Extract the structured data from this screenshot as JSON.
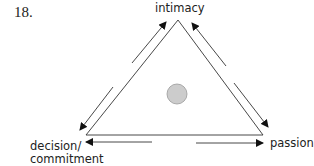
{
  "figure": {
    "number": "18."
  },
  "nodes": {
    "top": "intimacy",
    "bottom_left_line1": "decision/",
    "bottom_left_line2": "commitment",
    "bottom_right": "passion"
  },
  "center_marker": {
    "shape": "circle",
    "fill": "#cccccc",
    "stroke": "#999999"
  },
  "edges": [
    {
      "from": "decision/commitment",
      "to": "intimacy",
      "bidirectional": true
    },
    {
      "from": "intimacy",
      "to": "passion",
      "bidirectional": true
    },
    {
      "from": "decision/commitment",
      "to": "passion",
      "bidirectional": true
    }
  ]
}
